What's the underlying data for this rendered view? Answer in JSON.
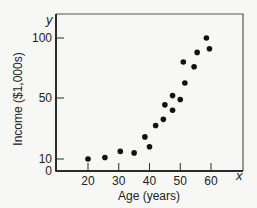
{
  "chart_data": {
    "type": "scatter",
    "title": "",
    "xlabel": "Age (years)",
    "ylabel": "Income ($1,000s)",
    "x_axis_var": "x",
    "y_axis_var": "y",
    "x_ticks": [
      20,
      30,
      40,
      50,
      60
    ],
    "y_ticks": [
      0,
      10,
      50,
      100
    ],
    "xlim": [
      10,
      70
    ],
    "ylim": [
      0,
      110
    ],
    "grid": false,
    "legend": null,
    "points": [
      {
        "x": 20,
        "y": 10
      },
      {
        "x": 25.5,
        "y": 11
      },
      {
        "x": 30.5,
        "y": 15
      },
      {
        "x": 35,
        "y": 14
      },
      {
        "x": 38.5,
        "y": 24.5
      },
      {
        "x": 40,
        "y": 18
      },
      {
        "x": 42,
        "y": 32
      },
      {
        "x": 44.5,
        "y": 36
      },
      {
        "x": 45,
        "y": 45.5
      },
      {
        "x": 47.5,
        "y": 42
      },
      {
        "x": 47.5,
        "y": 52
      },
      {
        "x": 50,
        "y": 49
      },
      {
        "x": 51.5,
        "y": 62.5
      },
      {
        "x": 51,
        "y": 80
      },
      {
        "x": 54.5,
        "y": 76
      },
      {
        "x": 55.5,
        "y": 88
      },
      {
        "x": 58.5,
        "y": 100
      },
      {
        "x": 59.5,
        "y": 91
      }
    ]
  },
  "colors": {
    "axis": "#2a2a2a",
    "point": "#111111",
    "background": "#f7f7f5"
  }
}
